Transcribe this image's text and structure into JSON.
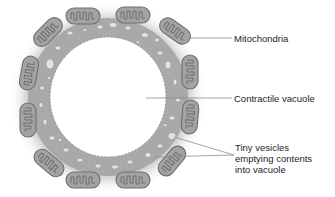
{
  "diagram": {
    "colors": {
      "background": "#ffffff",
      "cytoplasm": "#a9a9a9",
      "vesicle": "#e2e2e2",
      "mitochondrion_fill": "#a3a3a3",
      "mitochondrion_outline": "#6e6e6e",
      "leader_line": "#8c8c8c",
      "label_text": "#1e1e1e"
    },
    "labels": [
      {
        "id": "mitochondria",
        "text": "Mitochondria"
      },
      {
        "id": "contractile-vacuole",
        "text": "Contractile vacuole"
      },
      {
        "id": "tiny-vesicles",
        "lines": [
          "Tiny vesicles",
          "emptying contents",
          "into vacuole"
        ]
      }
    ]
  }
}
